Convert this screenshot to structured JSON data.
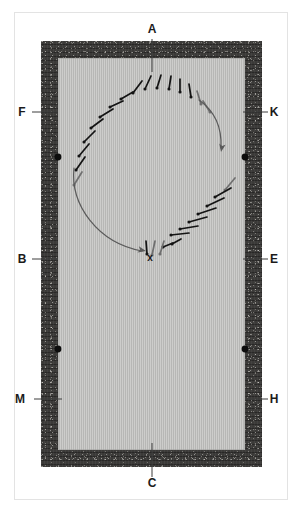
{
  "figure": {
    "type": "archaeological-plan",
    "colors": {
      "wall_fill": "#3b3a38",
      "floor_fill": "#bfbfbd",
      "frame_line": "#e3e3e3",
      "nail_dark": "#141414",
      "nail_light": "#6f6f6f",
      "flow_arrow": "#5a5a5a",
      "post_dot": "#0d0d0d",
      "label_text": "#1b1b1b",
      "page_background": "#ffffff"
    }
  },
  "labels": [
    {
      "id": "A",
      "text": "A",
      "position": "top",
      "x": 152,
      "y": 33,
      "leader": {
        "x1": 152,
        "y1": 39,
        "x2": 152,
        "y2": 72
      }
    },
    {
      "id": "F",
      "text": "F",
      "position": "left-upper",
      "x": 22,
      "y": 116,
      "leader": {
        "x1": 32,
        "y1": 112,
        "x2": 58,
        "y2": 112
      }
    },
    {
      "id": "K",
      "text": "K",
      "position": "right-upper",
      "x": 274,
      "y": 116,
      "leader": {
        "x1": 268,
        "y1": 112,
        "x2": 243,
        "y2": 112
      }
    },
    {
      "id": "B",
      "text": "B",
      "position": "left-middle",
      "x": 22,
      "y": 263,
      "leader": {
        "x1": 32,
        "y1": 259,
        "x2": 58,
        "y2": 259
      }
    },
    {
      "id": "E",
      "text": "E",
      "position": "right-middle",
      "x": 274,
      "y": 263,
      "leader": {
        "x1": 268,
        "y1": 259,
        "x2": 243,
        "y2": 259
      }
    },
    {
      "id": "M",
      "text": "M",
      "position": "left-lower",
      "x": 20,
      "y": 403,
      "leader": {
        "x1": 34,
        "y1": 399,
        "x2": 62,
        "y2": 399
      }
    },
    {
      "id": "H",
      "text": "H",
      "position": "right-lower",
      "x": 274,
      "y": 403,
      "leader": {
        "x1": 268,
        "y1": 399,
        "x2": 248,
        "y2": 399
      }
    },
    {
      "id": "C",
      "text": "C",
      "position": "bottom",
      "x": 152,
      "y": 487,
      "leader": {
        "x1": 152,
        "y1": 477,
        "x2": 152,
        "y2": 443
      }
    },
    {
      "id": "X",
      "text": "x",
      "position": "inner-centre-marker",
      "x": 150,
      "y": 261,
      "leader": null
    }
  ],
  "post_dots": [
    {
      "name": "post-hole-upper-left",
      "cx": 58,
      "cy": 157,
      "r": 3.4
    },
    {
      "name": "post-hole-upper-right",
      "cx": 245,
      "cy": 157,
      "r": 3.4
    },
    {
      "name": "post-hole-lower-left",
      "cx": 58,
      "cy": 349,
      "r": 3.4
    },
    {
      "name": "post-hole-lower-right",
      "cx": 245,
      "cy": 349,
      "r": 3.4
    }
  ],
  "nails": [
    {
      "i": 1,
      "hx": 74,
      "hy": 185,
      "tx": 82,
      "ty": 172,
      "shade": "light"
    },
    {
      "i": 2,
      "hx": 76,
      "hy": 170,
      "tx": 85,
      "ty": 157,
      "shade": "dark"
    },
    {
      "i": 3,
      "hx": 79,
      "hy": 156,
      "tx": 89,
      "ty": 144,
      "shade": "dark"
    },
    {
      "i": 4,
      "hx": 84,
      "hy": 142,
      "tx": 95,
      "ty": 131,
      "shade": "dark"
    },
    {
      "i": 5,
      "hx": 91,
      "hy": 128,
      "tx": 103,
      "ty": 119,
      "shade": "dark"
    },
    {
      "i": 6,
      "hx": 100,
      "hy": 117,
      "tx": 113,
      "ty": 109,
      "shade": "dark"
    },
    {
      "i": 7,
      "hx": 110,
      "hy": 107,
      "tx": 123,
      "ty": 101,
      "shade": "dark"
    },
    {
      "i": 8,
      "hx": 121,
      "hy": 99,
      "tx": 133,
      "ty": 92,
      "shade": "dark"
    },
    {
      "i": 9,
      "hx": 133,
      "hy": 93,
      "tx": 142,
      "ty": 81,
      "shade": "dark"
    },
    {
      "i": 10,
      "hx": 145,
      "hy": 89,
      "tx": 151,
      "ty": 76,
      "shade": "dark"
    },
    {
      "i": 11,
      "hx": 157,
      "hy": 88,
      "tx": 161,
      "ty": 75,
      "shade": "dark"
    },
    {
      "i": 12,
      "hx": 169,
      "hy": 89,
      "tx": 171,
      "ty": 76,
      "shade": "dark"
    },
    {
      "i": 13,
      "hx": 180,
      "hy": 92,
      "tx": 180,
      "ty": 79,
      "shade": "dark"
    },
    {
      "i": 14,
      "hx": 191,
      "hy": 97,
      "tx": 189,
      "ty": 84,
      "shade": "dark"
    },
    {
      "i": 15,
      "hx": 201,
      "hy": 104,
      "tx": 197,
      "ty": 91,
      "shade": "light"
    },
    {
      "i": 16,
      "hx": 210,
      "hy": 112,
      "tx": 203,
      "ty": 101,
      "shade": "light"
    },
    {
      "i": 17,
      "hx": 225,
      "hy": 190,
      "tx": 235,
      "ty": 178,
      "shade": "light"
    },
    {
      "i": 18,
      "hx": 215,
      "hy": 197,
      "tx": 231,
      "ty": 188,
      "shade": "dark"
    },
    {
      "i": 19,
      "hx": 207,
      "hy": 206,
      "tx": 224,
      "ty": 198,
      "shade": "dark"
    },
    {
      "i": 20,
      "hx": 198,
      "hy": 214,
      "tx": 216,
      "ty": 208,
      "shade": "dark"
    },
    {
      "i": 21,
      "hx": 189,
      "hy": 222,
      "tx": 207,
      "ty": 217,
      "shade": "dark"
    },
    {
      "i": 22,
      "hx": 180,
      "hy": 229,
      "tx": 198,
      "ty": 226,
      "shade": "dark"
    },
    {
      "i": 23,
      "hx": 171,
      "hy": 235,
      "tx": 189,
      "ty": 233,
      "shade": "dark"
    },
    {
      "i": 24,
      "hx": 172,
      "hy": 244,
      "tx": 181,
      "ty": 239,
      "shade": "dark"
    },
    {
      "i": 25,
      "hx": 163,
      "hy": 247,
      "tx": 173,
      "ty": 243,
      "shade": "dark"
    },
    {
      "i": 26,
      "hx": 160,
      "hy": 254,
      "tx": 164,
      "ty": 241,
      "shade": "light"
    },
    {
      "i": 27,
      "hx": 152,
      "hy": 255,
      "tx": 155,
      "ty": 241,
      "shade": "light"
    },
    {
      "i": 28,
      "hx": 147,
      "hy": 254,
      "tx": 146,
      "ty": 241,
      "shade": "dark"
    }
  ],
  "flow_arrows": [
    {
      "name": "flow-arrow-right",
      "path": "M 199,100 C 216,112 222,128 221,148",
      "arrowhead": {
        "cx": 221,
        "cy": 152,
        "angle": 100
      }
    },
    {
      "name": "flow-arrow-left",
      "path": "M 74,168 C 70,205 98,243 142,251",
      "arrowhead": {
        "cx": 146,
        "cy": 251,
        "angle": 12
      }
    }
  ]
}
